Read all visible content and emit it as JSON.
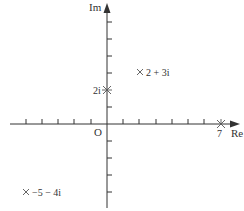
{
  "diagram": {
    "type": "complex-plane",
    "axes": {
      "x_label": "Re",
      "y_label": "Im",
      "origin_label": "O",
      "x_ticks": [
        -6,
        -5,
        -4,
        -3,
        -2,
        -1,
        1,
        2,
        3,
        4,
        5,
        6,
        7
      ],
      "y_ticks": [
        -4,
        -3,
        -2,
        -1,
        1,
        2,
        3,
        4,
        5,
        6
      ]
    },
    "points": [
      {
        "label": "2 + 3i",
        "re": 2,
        "im": 3,
        "marker": "cross"
      },
      {
        "label": "2i",
        "re": 0,
        "im": 2,
        "marker": "asterisk"
      },
      {
        "label": "7",
        "re": 7,
        "im": 0,
        "marker": "asterisk"
      },
      {
        "label": "−5 − 4i",
        "re": -5,
        "im": -4,
        "marker": "cross"
      }
    ],
    "colors": {
      "axis": "#333333",
      "marker": "#555555",
      "text": "#333333"
    }
  }
}
